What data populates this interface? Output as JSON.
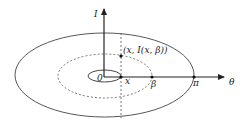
{
  "diagram": {
    "axes": {
      "vertical_label": "I",
      "horizontal_label": "θ"
    },
    "points": {
      "origin": "0",
      "x": "x",
      "beta": "β",
      "pi": "π",
      "point_label": "(x, I(x, β))"
    },
    "curves": [
      {
        "name": "outer-orbit",
        "style": "solid"
      },
      {
        "name": "middle-orbit",
        "style": "dashed"
      },
      {
        "name": "inner-orbit",
        "style": "solid"
      }
    ],
    "colors": {
      "stroke": "#333333",
      "text": "#222222"
    }
  }
}
